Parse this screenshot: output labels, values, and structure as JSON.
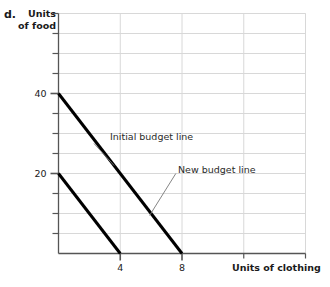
{
  "figure": {
    "part_letter": "d.",
    "y_axis_title_line1": "Units",
    "y_axis_title_line2": "of food",
    "x_axis_title": "Units of clothing"
  },
  "chart_data": {
    "type": "line",
    "title": "",
    "xlabel": "Units of clothing",
    "ylabel": "Units of food",
    "xlim": [
      0,
      16
    ],
    "ylim": [
      0,
      60
    ],
    "xticks": [
      4,
      8
    ],
    "xtick_labels": [
      "4",
      "8"
    ],
    "yticks": [
      20,
      40
    ],
    "ytick_labels": [
      "20",
      "40"
    ],
    "grid": true,
    "grid_x_step": 4,
    "grid_y_step": 5,
    "legend": "none",
    "series": [
      {
        "name": "Initial budget line",
        "x": [
          0,
          8
        ],
        "y": [
          40,
          0
        ],
        "color": "#000000",
        "width": 3,
        "annotation": {
          "text": "Initial budget line",
          "text_x": 2.3,
          "text_y": 27.5,
          "point_x": 3.6,
          "point_y": 22.0
        }
      },
      {
        "name": "New budget line",
        "x": [
          0,
          4
        ],
        "y": [
          20,
          0
        ],
        "color": "#000000",
        "width": 3,
        "annotation": {
          "text": "New budget line",
          "text_x": 7.6,
          "text_y": 20.0,
          "point_x": 5.9,
          "point_y": 9.5
        }
      }
    ]
  }
}
